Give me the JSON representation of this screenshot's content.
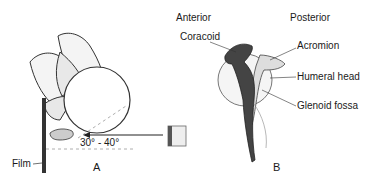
{
  "figure": {
    "panel_a": {
      "label": "A",
      "film_label": "Film",
      "angle_label": "30° - 40°"
    },
    "panel_b": {
      "label": "B",
      "orientation_left": "Anterior",
      "orientation_right": "Posterior",
      "structures": [
        {
          "name": "Coracoid"
        },
        {
          "name": "Acromion"
        },
        {
          "name": "Humeral head"
        },
        {
          "name": "Glenoid fossa"
        }
      ]
    }
  }
}
